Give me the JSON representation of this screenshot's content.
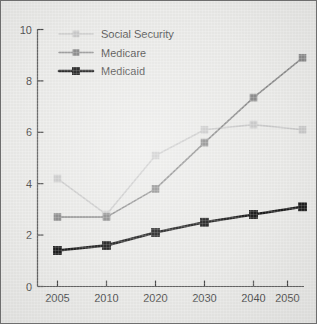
{
  "chart_data": {
    "type": "line",
    "title": "",
    "subtitle": "",
    "xlabel": "",
    "ylabel": "",
    "categories": [
      "2005",
      "2010",
      "2020",
      "2030",
      "2040",
      "2050"
    ],
    "ylim": [
      0,
      10
    ],
    "yticks": [
      "0",
      "2",
      "4",
      "6",
      "8",
      "10"
    ],
    "ytick_values": [
      0,
      2,
      4,
      6,
      8,
      10
    ],
    "grid": false,
    "legend_position": "top-left inside plot area",
    "series": [
      {
        "name": "Social Security",
        "values": [
          4.2,
          2.8,
          5.1,
          6.1,
          6.3,
          6.1
        ],
        "color": "#c9c9c9",
        "marker": "square",
        "line_width": 1.6
      },
      {
        "name": "Medicare",
        "values": [
          2.7,
          2.7,
          3.8,
          5.6,
          7.35,
          8.9
        ],
        "color": "#8a8a8a",
        "marker": "square",
        "line_width": 1.6
      },
      {
        "name": "Medicaid",
        "values": [
          1.4,
          1.6,
          2.1,
          2.5,
          2.8,
          3.1
        ],
        "color": "#1c1c1c",
        "marker": "square",
        "line_width": 2.6
      }
    ]
  },
  "figure": {
    "background_color": "#e9e9e7",
    "border_color": "#6e6e6e",
    "axis_color": "#4a4a4a",
    "text_color": "#4e4e4e"
  }
}
